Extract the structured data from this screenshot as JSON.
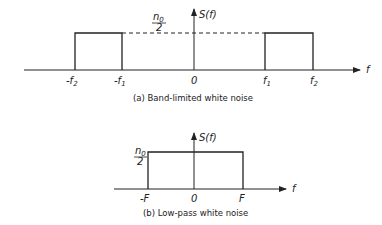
{
  "figure_a": {
    "y_label": "S(f)",
    "x_label": "f",
    "level_num": "n",
    "level_sub": "0",
    "level_den": "2",
    "ticks": {
      "neg_f2": "-f",
      "neg_f2_sub": "2",
      "neg_f1": "-f",
      "neg_f1_sub": "1",
      "zero": "0",
      "f1": "f",
      "f1_sub": "1",
      "f2": "f",
      "f2_sub": "2"
    },
    "caption": "(a) Band-limited white noise"
  },
  "figure_b": {
    "y_label": "S(f)",
    "x_label": "f",
    "level_num": "n",
    "level_sub": "0",
    "level_den": "2",
    "ticks": {
      "neg_F": "-F",
      "zero": "0",
      "F": "F"
    },
    "caption": "(b) Low-pass white noise"
  },
  "colors": {
    "line": "#222222",
    "background": "#ffffff"
  }
}
